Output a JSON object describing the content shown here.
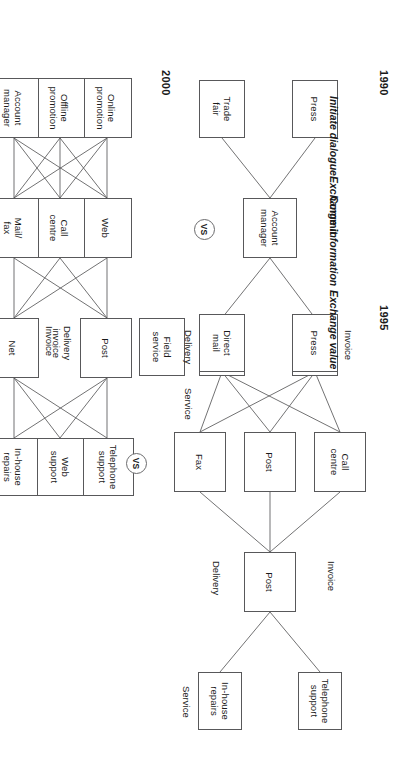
{
  "figure": {
    "vs_label": "VS",
    "line_color": "#58585a",
    "text_color": "#1a1a1a"
  },
  "years": [
    {
      "id": "y1990",
      "label": "1990"
    },
    {
      "id": "y1995",
      "label": "1995"
    },
    {
      "id": "y2000",
      "label": "2000"
    }
  ],
  "stages": [
    {
      "id": "initiate",
      "label": "Initiate dialogue",
      "style": "italic"
    },
    {
      "id": "exchange_info",
      "label": "Exchange information",
      "style": "italic"
    },
    {
      "id": "commit",
      "label": "Commit",
      "style": "bold"
    },
    {
      "id": "exchange_value",
      "label": "Exchange value",
      "style": "italic"
    }
  ],
  "columns_1990": {
    "initiate": [
      {
        "id": "c90-press",
        "label": "Press"
      },
      {
        "id": "c90-tradefair",
        "label": "Trade\nfair"
      }
    ],
    "exchange_info": [
      {
        "id": "c90-acctmgr",
        "label": "Account\nmanager"
      }
    ],
    "exchange_value": [
      {
        "id": "c90-post",
        "label": "Post"
      },
      {
        "id": "c90-logistics",
        "label": "In-house\nlogistics"
      }
    ],
    "service": [
      {
        "id": "c90-fieldservice",
        "label": "Field\nservice"
      }
    ],
    "edge_labels": [
      {
        "id": "c90-lab-invoice",
        "label": "Invoice"
      },
      {
        "id": "c90-lab-delivery",
        "label": "Delivery"
      },
      {
        "id": "c90-lab-service",
        "label": "Service"
      }
    ]
  },
  "columns_1995": {
    "initiate": [
      {
        "id": "c95-press",
        "label": "Press"
      },
      {
        "id": "c95-directmail",
        "label": "Direct\nmail"
      }
    ],
    "exchange_info": [
      {
        "id": "c95-callcentre",
        "label": "Call\ncentre"
      },
      {
        "id": "c95-post",
        "label": "Post"
      },
      {
        "id": "c95-fax",
        "label": "Fax"
      }
    ],
    "exchange_value": [
      {
        "id": "c95-postdel",
        "label": "Post"
      }
    ],
    "service": [
      {
        "id": "c95-telsupport",
        "label": "Telephone\nsupport"
      },
      {
        "id": "c95-inhouse",
        "label": "In-house\nrepairs"
      }
    ],
    "edge_labels": [
      {
        "id": "c95-lab-delivery",
        "label": "Delivery"
      },
      {
        "id": "c95-lab-invoice",
        "label": "Invoice"
      },
      {
        "id": "c95-lab-service",
        "label": "Service"
      }
    ]
  },
  "columns_2000": {
    "initiate": [
      {
        "id": "c00-online",
        "label": "Online\npromotion"
      },
      {
        "id": "c00-offline",
        "label": "Offline\npromotion"
      },
      {
        "id": "c00-acctmgr",
        "label": "Account\nmanager"
      }
    ],
    "exchange_info": [
      {
        "id": "c00-web",
        "label": "Web"
      },
      {
        "id": "c00-callcentre",
        "label": "Call\ncentre"
      },
      {
        "id": "c00-mailfax",
        "label": "Mail/\nfax"
      }
    ],
    "exchange_value": [
      {
        "id": "c00-post",
        "label": "Post"
      },
      {
        "id": "c00-net",
        "label": "Net"
      }
    ],
    "service": [
      {
        "id": "c00-telsupport",
        "label": "Telephone\nsupport"
      },
      {
        "id": "c00-websupport",
        "label": "Web\nsupport"
      },
      {
        "id": "c00-inhouse",
        "label": "In-house\nrepairs"
      }
    ],
    "edge_labels": [
      {
        "id": "c00-lab-delinv",
        "label": "Delivery\ninvoice"
      },
      {
        "id": "c00-lab-invoice",
        "label": "Invoice"
      }
    ]
  }
}
